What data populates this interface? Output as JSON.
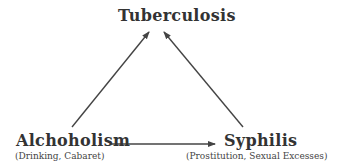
{
  "diagram": {
    "nodes": {
      "tuberculosis": {
        "label": "Tuberculosis"
      },
      "alcoholism": {
        "label": "Alchoholism",
        "sublabel": "(Drinking, Cabaret)"
      },
      "syphilis": {
        "label": "Syphilis",
        "sublabel": "(Prostitution, Sexual Excesses)"
      }
    },
    "edges": [
      {
        "from": "Alchoholism",
        "to": "Tuberculosis"
      },
      {
        "from": "Syphilis",
        "to": "Tuberculosis"
      },
      {
        "from": "Alchoholism",
        "to": "Syphilis"
      }
    ],
    "colors": {
      "text": "#333333",
      "arrow": "#444444",
      "background": "#ffffff"
    }
  }
}
